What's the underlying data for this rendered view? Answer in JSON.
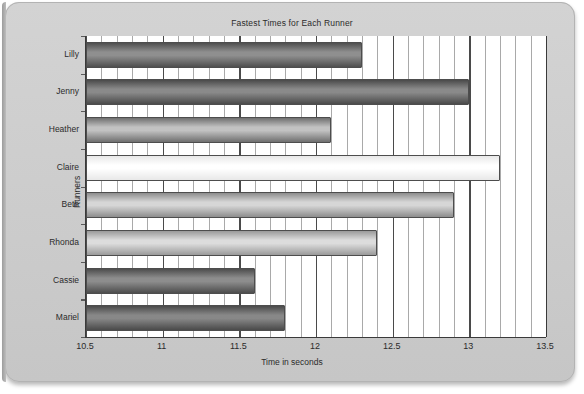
{
  "chart_data": {
    "type": "bar",
    "orientation": "horizontal",
    "title": "Fastest Times for Each Runner",
    "xlabel": "Time in seconds",
    "ylabel": "Runners",
    "categories": [
      "Mariel",
      "Cassie",
      "Rhonda",
      "Beth",
      "Claire",
      "Heather",
      "Jenny",
      "Lilly"
    ],
    "values": [
      11.8,
      11.6,
      12.4,
      12.9,
      13.2,
      12.1,
      13.0,
      12.3
    ],
    "display_order_top_to_bottom": [
      "Lilly",
      "Jenny",
      "Heather",
      "Claire",
      "Beth",
      "Rhonda",
      "Cassie",
      "Mariel"
    ],
    "xlim": [
      10.5,
      13.5
    ],
    "xticks": [
      "10.5",
      "11",
      "11.5",
      "12",
      "12.5",
      "13",
      "13.5"
    ],
    "xtick_values": [
      10.5,
      11,
      11.5,
      12,
      12.5,
      13,
      13.5
    ],
    "minor_tick_step": 0.1,
    "grid": true,
    "legend": null,
    "bars": [
      {
        "label": "Lilly",
        "value": 12.3,
        "shade_dark": "#4f4f4f",
        "shade_light": "#8f8f8f"
      },
      {
        "label": "Jenny",
        "value": 13.0,
        "shade_dark": "#4a4a4a",
        "shade_light": "#8a8a8a"
      },
      {
        "label": "Heather",
        "value": 12.1,
        "shade_dark": "#6f6f6f",
        "shade_light": "#c2c2c2"
      },
      {
        "label": "Claire",
        "value": 13.2,
        "shade_dark": "#e8e8e8",
        "shade_light": "#ffffff"
      },
      {
        "label": "Beth",
        "value": 12.9,
        "shade_dark": "#8d8d8d",
        "shade_light": "#d6d6d6"
      },
      {
        "label": "Rhonda",
        "value": 12.4,
        "shade_dark": "#9a9a9a",
        "shade_light": "#dcdcdc"
      },
      {
        "label": "Cassie",
        "value": 11.6,
        "shade_dark": "#4d4d4d",
        "shade_light": "#8d8d8d"
      },
      {
        "label": "Mariel",
        "value": 11.8,
        "shade_dark": "#4a4a4a",
        "shade_light": "#888888"
      }
    ],
    "colors": {
      "plot_background": "#ffffff",
      "page_background": "#cfcfcf",
      "axis": "#3a3a3a",
      "gridline_major": "#4a4a4a",
      "gridline_minor": "#a9a9a9",
      "text": "#2b2b2b"
    }
  }
}
